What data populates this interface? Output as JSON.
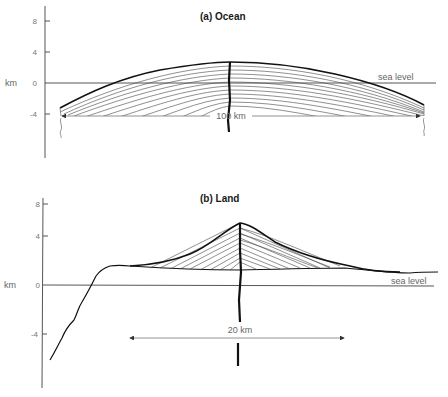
{
  "panels": {
    "ocean": {
      "title": "(a) Ocean",
      "unit_label": "km",
      "ticks": [
        "8",
        "4",
        "0",
        "-4"
      ],
      "sea_level_label": "sea level",
      "distance_label": "100 km"
    },
    "land": {
      "title": "(b) Land",
      "unit_label": "km",
      "ticks": [
        "8",
        "4",
        "0",
        "-4"
      ],
      "sea_level_label": "sea level",
      "distance_label": "20 km"
    }
  },
  "colors": {
    "line": "#111111",
    "axis": "#555555",
    "label": "#666666"
  }
}
